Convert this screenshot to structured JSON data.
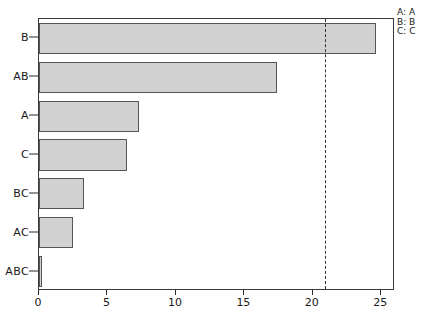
{
  "chart_data": {
    "type": "bar",
    "orientation": "horizontal",
    "title": "",
    "xlabel": "",
    "ylabel": "",
    "categories": [
      "B",
      "AB",
      "A",
      "C",
      "BC",
      "AC",
      "ABC"
    ],
    "values": [
      24.6,
      17.4,
      7.3,
      6.4,
      3.3,
      2.5,
      0.2
    ],
    "series": [
      {
        "name": "Standardized Effect",
        "values": [
          24.6,
          17.4,
          7.3,
          6.4,
          3.3,
          2.5,
          0.2
        ]
      }
    ],
    "xlim": [
      0,
      26
    ],
    "ylim": [
      0,
      7
    ],
    "xticks": [
      0,
      5,
      10,
      15,
      20,
      25
    ],
    "xtick_labels": [
      "0",
      "5",
      "10",
      "15",
      "20",
      "25"
    ],
    "ytick_labels": [
      "B",
      "AB",
      "A",
      "C",
      "BC",
      "AC",
      "ABC"
    ],
    "grid": false,
    "legend_position": "top-right",
    "bar_fill_color": "#d2d2d2",
    "bar_edge_color": "#555555",
    "reference_line": {
      "value": 20.9,
      "style": "dashed",
      "color": "#333333",
      "label": ""
    },
    "annotations": []
  },
  "legend": {
    "entries": [
      {
        "key": "A:",
        "value": "A"
      },
      {
        "key": "B:",
        "value": "B"
      },
      {
        "key": "C:",
        "value": "C"
      }
    ]
  }
}
